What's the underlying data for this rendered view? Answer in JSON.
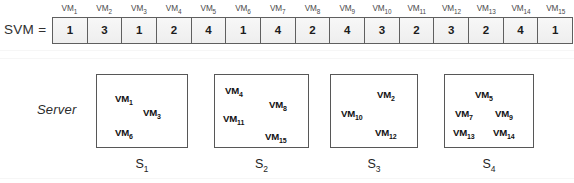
{
  "figure": {
    "svm": {
      "label": "SVM =",
      "headers": [
        "VM1",
        "VM2",
        "VM3",
        "VM4",
        "VM5",
        "VM6",
        "VM7",
        "VM8",
        "VM9",
        "VM10",
        "VM11",
        "VM12",
        "VM13",
        "VM14",
        "VM15"
      ],
      "header_bases": [
        "VM",
        "VM",
        "VM",
        "VM",
        "VM",
        "VM",
        "VM",
        "VM",
        "VM",
        "VM",
        "VM",
        "VM",
        "VM",
        "VM",
        "VM"
      ],
      "header_subs": [
        "1",
        "2",
        "3",
        "4",
        "5",
        "6",
        "7",
        "8",
        "9",
        "10",
        "11",
        "12",
        "13",
        "14",
        "15"
      ],
      "values": [
        1,
        3,
        1,
        2,
        4,
        1,
        4,
        2,
        4,
        3,
        2,
        3,
        2,
        4,
        1
      ]
    },
    "server_row_label": "Server",
    "servers": [
      {
        "caption_base": "S",
        "caption_sub": "1",
        "caption": "S1",
        "vms": [
          {
            "base": "VM",
            "sub": "1",
            "x": 18,
            "y": 18
          },
          {
            "base": "VM",
            "sub": "3",
            "x": 46,
            "y": 32
          },
          {
            "base": "VM",
            "sub": "6",
            "x": 18,
            "y": 52
          }
        ]
      },
      {
        "caption_base": "S",
        "caption_sub": "2",
        "caption": "S2",
        "vms": [
          {
            "base": "VM",
            "sub": "4",
            "x": 10,
            "y": 10
          },
          {
            "base": "VM",
            "sub": "8",
            "x": 54,
            "y": 24
          },
          {
            "base": "VM",
            "sub": "11",
            "x": 8,
            "y": 38
          },
          {
            "base": "VM",
            "sub": "15",
            "x": 50,
            "y": 56
          }
        ]
      },
      {
        "caption_base": "S",
        "caption_sub": "3",
        "caption": "S3",
        "vms": [
          {
            "base": "VM",
            "sub": "2",
            "x": 46,
            "y": 14
          },
          {
            "base": "VM",
            "sub": "10",
            "x": 10,
            "y": 33
          },
          {
            "base": "VM",
            "sub": "12",
            "x": 44,
            "y": 52
          }
        ]
      },
      {
        "caption_base": "S",
        "caption_sub": "4",
        "caption": "S4",
        "vms": [
          {
            "base": "VM",
            "sub": "5",
            "x": 30,
            "y": 14
          },
          {
            "base": "VM",
            "sub": "7",
            "x": 10,
            "y": 33
          },
          {
            "base": "VM",
            "sub": "9",
            "x": 50,
            "y": 33
          },
          {
            "base": "VM",
            "sub": "13",
            "x": 8,
            "y": 52
          },
          {
            "base": "VM",
            "sub": "14",
            "x": 48,
            "y": 52
          }
        ]
      }
    ],
    "colors": {
      "cell_border": "#5f5f5f",
      "cell_fill": "#f3f3f3",
      "box_border": "#575757",
      "text": "#1a1a1a",
      "background": "#ffffff"
    }
  }
}
